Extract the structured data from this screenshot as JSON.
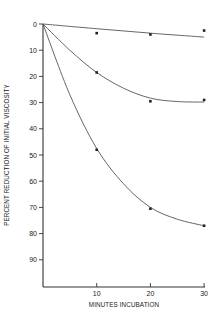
{
  "chart_data": {
    "type": "line",
    "title": "",
    "xlabel": "MINUTES INCUBATION",
    "ylabel": "PERCENT REDUCTION OF INITIAL VISCOSITY",
    "x_ticks": [
      10,
      20,
      30
    ],
    "y_ticks": [
      0,
      10,
      20,
      30,
      40,
      50,
      60,
      70,
      80,
      90
    ],
    "xlim": [
      0,
      30
    ],
    "ylim": [
      0,
      100
    ],
    "y_inverted": true,
    "grid": false,
    "legend": null,
    "series": [
      {
        "name": "top curve",
        "x": [
          10,
          20,
          30
        ],
        "values": [
          3.5,
          4,
          2.5
        ],
        "fit": [
          [
            0,
            0
          ],
          [
            10,
            1.8
          ],
          [
            20,
            3.5
          ],
          [
            30,
            5
          ]
        ]
      },
      {
        "name": "middle curve",
        "x": [
          10,
          20,
          30
        ],
        "values": [
          18.5,
          29.5,
          29
        ],
        "fit": [
          [
            0,
            0
          ],
          [
            5,
            10
          ],
          [
            10,
            18.5
          ],
          [
            15,
            24.5
          ],
          [
            20,
            28.3
          ],
          [
            25,
            29.6
          ],
          [
            30,
            29.8
          ]
        ]
      },
      {
        "name": "bottom curve",
        "x": [
          10,
          20,
          30
        ],
        "values": [
          48,
          70.5,
          77
        ],
        "fit": [
          [
            0,
            0
          ],
          [
            5,
            27
          ],
          [
            10,
            47.5
          ],
          [
            15,
            61
          ],
          [
            20,
            70
          ],
          [
            25,
            74.5
          ],
          [
            30,
            77
          ]
        ]
      }
    ]
  }
}
